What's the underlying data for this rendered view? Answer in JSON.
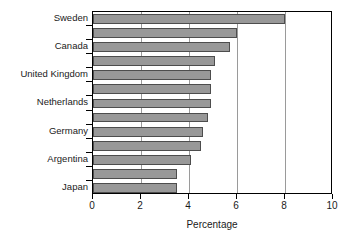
{
  "chart_data": {
    "type": "bar",
    "orientation": "horizontal",
    "title": "",
    "subtitle": "",
    "xlabel": "Percentage",
    "ylabel": "",
    "xlim": [
      0,
      10
    ],
    "xticks": [
      0,
      2,
      4,
      6,
      8,
      10
    ],
    "xtick_labels": [
      "0",
      "2",
      "4",
      "6",
      "8",
      "10"
    ],
    "grid": "vertical",
    "legend": "none",
    "bar_color": "#989898",
    "bar_edge_color": "#4d4d4d",
    "axis_color": "#000000",
    "gridline_color": "#9a9a9a",
    "categories": [
      "Sweden",
      "",
      "Canada",
      "",
      "United Kingdom",
      "",
      "Netherlands",
      "",
      "Germany",
      "",
      "Argentina",
      "",
      "Japan"
    ],
    "labeled_categories": [
      "Sweden",
      "Canada",
      "United Kingdom",
      "Netherlands",
      "Germany",
      "Argentina",
      "Japan"
    ],
    "values": [
      8.0,
      6.0,
      5.7,
      5.1,
      4.9,
      4.9,
      4.9,
      4.8,
      4.6,
      4.5,
      4.1,
      3.5,
      3.5
    ],
    "bar_count": 13
  }
}
